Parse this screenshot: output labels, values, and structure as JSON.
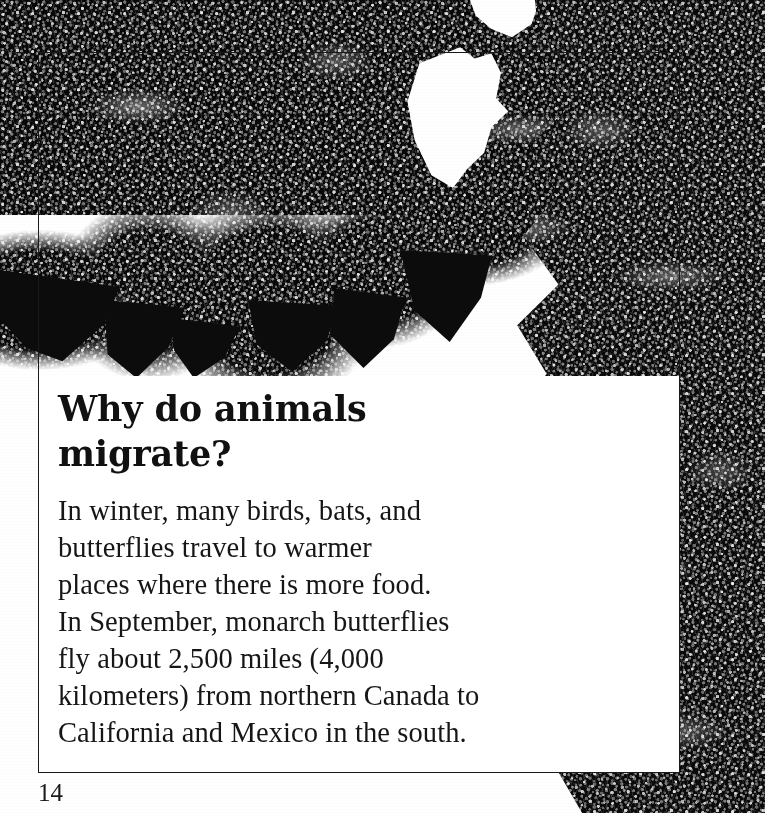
{
  "page": {
    "kind": "book-page-scan",
    "number": "14",
    "background_color": "#ffffff",
    "ink_color": "#161616",
    "border_color": "#1a1a1a"
  },
  "content": {
    "heading": "Why do animals migrate?",
    "heading_lines": [
      "Why do animals",
      "migrate?"
    ],
    "body": "In winter, many birds, bats, and butterflies travel to warmer places where there is more food. In September, monarch butterflies fly about 2,500 miles (4,000 kilometers) from northern Canada to California and Mexico in the south.",
    "body_lines": [
      "In winter, many birds, bats, and",
      "butterflies travel to warmer",
      "places where there is more food.",
      "In September, monarch butterflies",
      "fly about 2,500 miles (4,000",
      "kilometers) from northern Canada to",
      "California and Mexico in the south."
    ]
  },
  "photo": {
    "subject": "monarch-butterfly-cluster",
    "description": "Black and white photograph of thousands of monarch butterflies clustered on branches, hanging from the top of the page and massed down the right side.",
    "palette": {
      "dark": "#080808",
      "mid": "#8a8a8a",
      "light": "#ffffff"
    }
  }
}
